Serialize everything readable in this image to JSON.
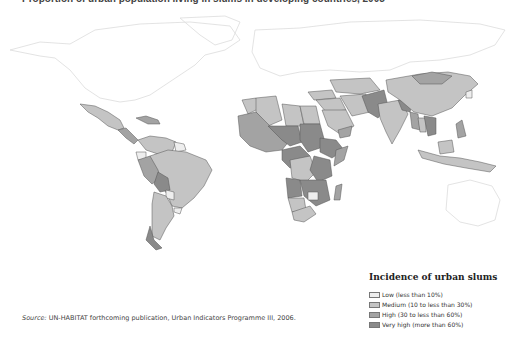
{
  "title": "Proportion of urban population living in slums in developing countries, 2005",
  "source": {
    "prefix": "Source:",
    "text": " UN-HABITAT forthcoming publication, Urban Indicators Programme III, 2006."
  },
  "legend": {
    "title": "Incidence of urban slums",
    "items": [
      {
        "label": "Low (less than 10%)",
        "color": "#eeeeee"
      },
      {
        "label": "Medium (10 to less than 30%)",
        "color": "#c4c4c4"
      },
      {
        "label": "High (30 to less than 60%)",
        "color": "#a3a3a3"
      },
      {
        "label": "Very high (more than 60%)",
        "color": "#8a8a8a"
      }
    ]
  },
  "colors": {
    "low": "#eeeeee",
    "medium": "#c4c4c4",
    "high": "#a3a3a3",
    "very_high": "#8a8a8a",
    "border": "#555555",
    "no_data_outline": "#dddddd"
  }
}
